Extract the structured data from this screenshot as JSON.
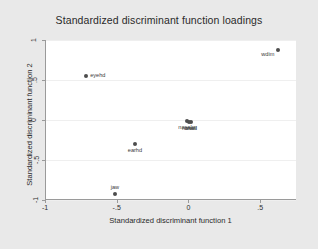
{
  "chart_data": {
    "type": "scatter",
    "title": "Standardized discriminant function loadings",
    "xlabel": "Standardized discriminant function 1",
    "ylabel": "Standardized discriminant function 2",
    "xlim": [
      -1.0,
      0.75
    ],
    "ylim": [
      -1.0,
      1.0
    ],
    "xticks": [
      -1,
      -0.5,
      0,
      0.5
    ],
    "xticklabels": [
      "-1",
      "-.5",
      "0",
      ".5"
    ],
    "yticks": [
      -1,
      -0.5,
      0,
      0.5,
      1
    ],
    "yticklabels": [
      "-1",
      "-.5",
      "0",
      ".5",
      "1"
    ],
    "grid": "horizontal",
    "legend": "none",
    "marker_color": "#4d4d4d",
    "panel_color": "#ffffff",
    "background_color": "#e9e9e9",
    "gridline_color": "#efefef",
    "points": [
      {
        "label": "wdim",
        "x": 0.62,
        "y": 0.87,
        "label_pos": "left"
      },
      {
        "label": "eyehd",
        "x": -0.72,
        "y": 0.55,
        "label_pos": "right"
      },
      {
        "label": "earhd",
        "x": -0.38,
        "y": -0.3,
        "label_pos": "below"
      },
      {
        "label": "jaw",
        "x": -0.52,
        "y": -0.92,
        "label_pos": "above"
      },
      {
        "label": "nasaln",
        "x": -0.02,
        "y": -0.01,
        "label_pos": "below"
      },
      {
        "label": "nasall",
        "x": 0.0,
        "y": -0.02,
        "label_pos": "below"
      },
      {
        "label": "cranl",
        "x": 0.01,
        "y": -0.02,
        "label_pos": "below"
      }
    ]
  }
}
